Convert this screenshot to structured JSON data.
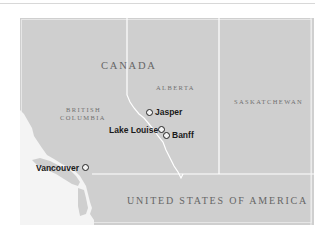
{
  "map": {
    "colors": {
      "land": "#cfcfcf",
      "water": "#f4f4f4",
      "border": "#ffffff",
      "label": "#6a6a6a",
      "city_label": "#1a1a1a"
    },
    "countries": {
      "canada": "CANADA",
      "usa": "UNITED STATES OF AMERICA"
    },
    "provinces": {
      "bc_line1": "British",
      "bc_line2": "Columbia",
      "alberta": "Alberta",
      "saskatchewan": "Saskatchewan"
    },
    "cities": {
      "jasper": "Jasper",
      "lake_louise": "Lake Louise",
      "banff": "Banff",
      "vancouver": "Vancouver"
    },
    "icons": {
      "city_marker": "open-circle"
    }
  }
}
